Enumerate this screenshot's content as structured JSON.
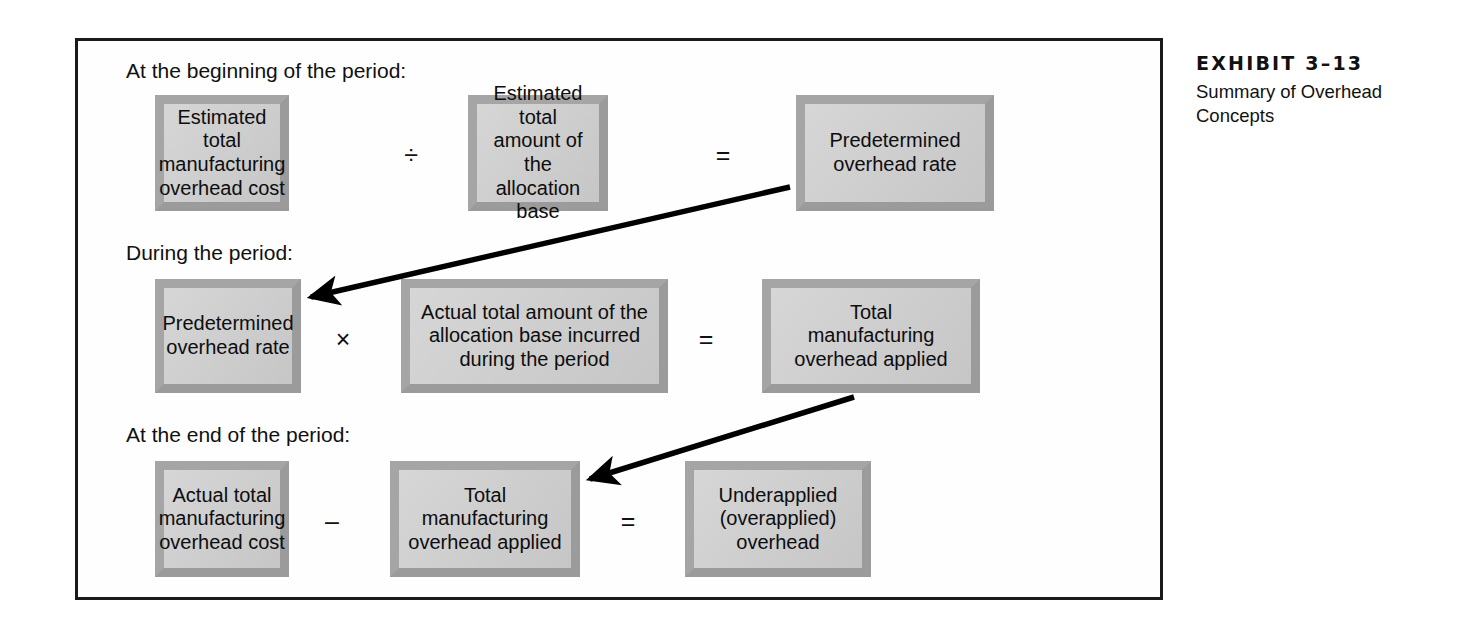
{
  "exhibit": {
    "number_label": "EXHIBIT 3–13",
    "subtitle_line1": "Summary of Overhead",
    "subtitle_line2": "Concepts"
  },
  "sections": {
    "beginning_label": "At the beginning of the period:",
    "during_label": "During the period:",
    "end_label": "At the end of the period:"
  },
  "rows": {
    "beginning": {
      "box1_line1": "Estimated total",
      "box1_line2": "manufacturing",
      "box1_line3": "overhead cost",
      "operator1": "÷",
      "box2_line1": "Estimated total",
      "box2_line2": "amount of the",
      "box2_line3": "allocation base",
      "operator2": "=",
      "box3_line1": "Predetermined",
      "box3_line2": "overhead rate"
    },
    "during": {
      "box1_line1": "Predetermined",
      "box1_line2": "overhead rate",
      "operator1": "×",
      "box2_line1": "Actual total amount of the",
      "box2_line2": "allocation base incurred",
      "box2_line3": "during the period",
      "operator2": "=",
      "box3_line1": "Total",
      "box3_line2": "manufacturing",
      "box3_line3": "overhead applied"
    },
    "end": {
      "box1_line1": "Actual total",
      "box1_line2": "manufacturing",
      "box1_line3": "overhead cost",
      "operator1": "–",
      "box2_line1": "Total",
      "box2_line2": "manufacturing",
      "box2_line3": "overhead applied",
      "operator2": "=",
      "box3_line1": "Underapplied",
      "box3_line2": "(overapplied)",
      "box3_line3": "overhead"
    }
  },
  "colors": {
    "frame_border": "#1a1a1a",
    "box_fill": "#cfcfcf",
    "box_border": "#a0a0a0",
    "arrow": "#000000",
    "text": "#101010"
  }
}
